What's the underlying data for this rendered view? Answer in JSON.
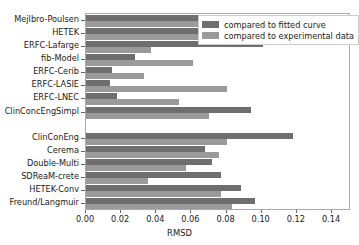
{
  "chart_data": {
    "type": "bar",
    "orientation": "horizontal",
    "title": "",
    "xlabel": "RMSD",
    "ylabel": "",
    "xlim": [
      0.0,
      0.1508
    ],
    "grid": false,
    "legend_position": "upper right",
    "xticks": [
      "0.00",
      "0.02",
      "0.04",
      "0.06",
      "0.08",
      "0.10",
      "0.12",
      "0.14"
    ],
    "xtick_values": [
      0.0,
      0.02,
      0.04,
      0.06,
      0.08,
      0.1,
      0.12,
      0.14
    ],
    "categories": [
      "Mejlbro-Poulsen",
      "HETEK",
      "ERFC-Lafarge",
      "fib-Model",
      "ERFC-Cerib",
      "ERFC-LASIE",
      "ERFC-LNEC",
      "ClinConcEngSimpl",
      "ClinConEng",
      "Cerema",
      "Double-Multi",
      "SDReaM-crete",
      "HETEK-Conv",
      "Freund/Langmuir"
    ],
    "series": [
      {
        "name": "compared to fitted curve",
        "color": "#6e6e6e",
        "values": [
          0.0925,
          0.0745,
          0.1007,
          0.0278,
          0.015,
          0.0135,
          0.0177,
          0.0938,
          0.1177,
          0.068,
          0.0715,
          0.077,
          0.0884,
          0.096
        ]
      },
      {
        "name": "compared to experimental data",
        "color": "#9a9a9a",
        "values": [
          0.074,
          0.1,
          0.037,
          0.061,
          0.033,
          0.08,
          0.0532,
          0.07,
          0.08,
          0.0755,
          0.057,
          0.035,
          0.077,
          0.0828
        ]
      }
    ]
  },
  "legend": {
    "entries": [
      {
        "label": "compared to fitted curve"
      },
      {
        "label": "compared to experimental data"
      }
    ]
  },
  "axis": {
    "x_title": "RMSD"
  }
}
